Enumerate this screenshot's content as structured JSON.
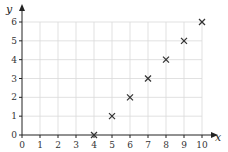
{
  "chart_data": {
    "type": "scatter",
    "title": "",
    "xlabel": "x",
    "ylabel": "y",
    "xlim": [
      0,
      10
    ],
    "ylim": [
      0,
      6
    ],
    "grid": true,
    "legend": null,
    "marker": "x",
    "x_ticks": [
      0,
      1,
      2,
      3,
      4,
      5,
      6,
      7,
      8,
      9,
      10
    ],
    "y_ticks": [
      0,
      1,
      2,
      3,
      4,
      5,
      6
    ],
    "points": [
      {
        "x": 4,
        "y": 0
      },
      {
        "x": 5,
        "y": 1
      },
      {
        "x": 6,
        "y": 2
      },
      {
        "x": 7,
        "y": 3
      },
      {
        "x": 8,
        "y": 4
      },
      {
        "x": 9,
        "y": 5
      },
      {
        "x": 10,
        "y": 6
      }
    ],
    "colors": {
      "axis": "#222222",
      "grid": "#d9d9d9",
      "marker": "#333333"
    }
  }
}
